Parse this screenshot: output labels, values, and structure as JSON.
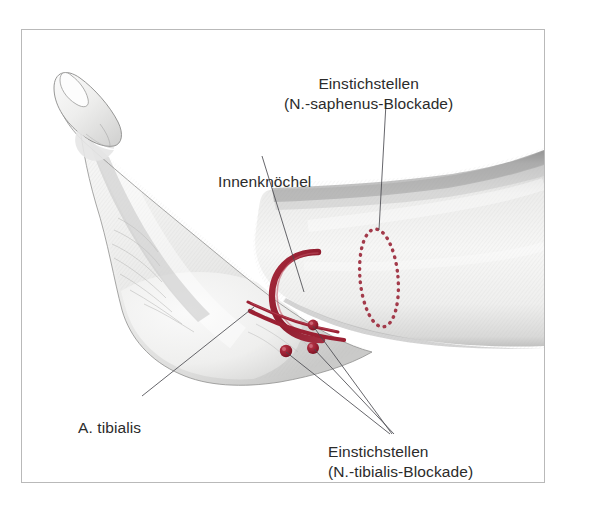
{
  "figure": {
    "frame_border_color": "#b9b9b9",
    "background_color": "#ffffff",
    "accent_red": "#9b2033",
    "dotted_red": "#a33a4a",
    "leader_line_color": "#55555a",
    "skin_light": "#f6f6f5",
    "skin_shadow": "#c9c9c9"
  },
  "labels": {
    "saphenus": {
      "line1": "Einstichstellen",
      "line2": "(N.-saphenus-Blockade)"
    },
    "innenknoechel": {
      "line1": "Innenknöchel"
    },
    "a_tibialis": {
      "line1": "A. tibialis"
    },
    "tibialis": {
      "line1": "Einstichstellen",
      "line2": "(N.-tibialis-Blockade)"
    }
  },
  "caption": {
    "text": ""
  },
  "markings": {
    "malleolus_arc_name": "Innenknöchel (medial malleolus) C-shaped arc",
    "artery_name": "A. tibialis posterior double line",
    "injection_dots_tibialis": 3,
    "saphenus_ellipse_name": "dotted ellipse injection zone"
  }
}
